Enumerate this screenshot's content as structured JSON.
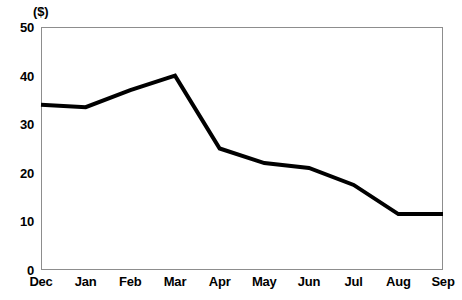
{
  "chart_data": {
    "type": "line",
    "title": "",
    "subtitle": "",
    "xlabel": "",
    "ylabel": "($)",
    "unit_label": "($)",
    "categories": [
      "Dec",
      "Jan",
      "Feb",
      "Mar",
      "Apr",
      "May",
      "Jun",
      "Jul",
      "Aug",
      "Sep"
    ],
    "values": [
      34,
      33.5,
      37,
      40,
      25,
      22,
      21,
      17.5,
      11.5,
      11.5
    ],
    "series": [
      {
        "name": "",
        "color": "#000000",
        "values": [
          34,
          33.5,
          37,
          40,
          25,
          22,
          21,
          17.5,
          11.5,
          11.5
        ]
      }
    ],
    "ylim": [
      0,
      50
    ],
    "y_ticks": [
      0,
      10,
      20,
      30,
      40,
      50
    ],
    "y_tick_labels": [
      "0",
      "10",
      "20",
      "30",
      "40",
      "50"
    ],
    "x_tick_labels": [
      "Dec",
      "Jan",
      "Feb",
      "Mar",
      "Apr",
      "May",
      "Jun",
      "Jul",
      "Aug",
      "Sep"
    ],
    "grid": false,
    "legend": "none",
    "markers": false,
    "line_width": 4,
    "frame_color": "#8d8d8d",
    "background": "#ffffff"
  }
}
